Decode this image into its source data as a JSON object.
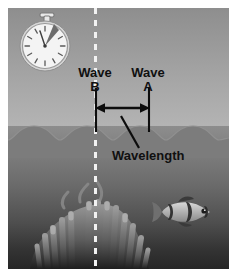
{
  "figure": {
    "background_color": "#ffffff"
  },
  "scene": {
    "sky_color_top": "#8e8e8e",
    "sky_color_bottom": "#b6b6b6",
    "water_color_top": "#8d8d8d",
    "water_color_bottom": "#262626",
    "wave_surface_color": "#7c7c7c",
    "wave_crest_count": 4,
    "wavelength_pixels": 53
  },
  "stopwatch": {
    "name": "stopwatch",
    "face_color": "#f0f0f0",
    "hand_color": "#4a4a4a",
    "hand_angle_degrees": 35,
    "tick_count": 12
  },
  "reference_line": {
    "name": "dashed-reference-line",
    "color": "#f2f2f2",
    "style": "dashed",
    "orientation": "vertical"
  },
  "labels": {
    "wave_b": "Wave\nB",
    "wave_b_word": "Wave",
    "wave_b_letter": "B",
    "wave_a_word": "Wave",
    "wave_a_letter": "A",
    "wavelength": "Wavelength"
  },
  "measurement": {
    "name": "wavelength-measure",
    "arrow_style": "double-headed",
    "left_marker": "Wave B",
    "right_marker": "Wave A",
    "annotation": "Wavelength",
    "line_color": "#000000"
  },
  "marine_life": {
    "anemone": "sea-anemone",
    "fish": "clownfish",
    "fish_count": 1
  }
}
